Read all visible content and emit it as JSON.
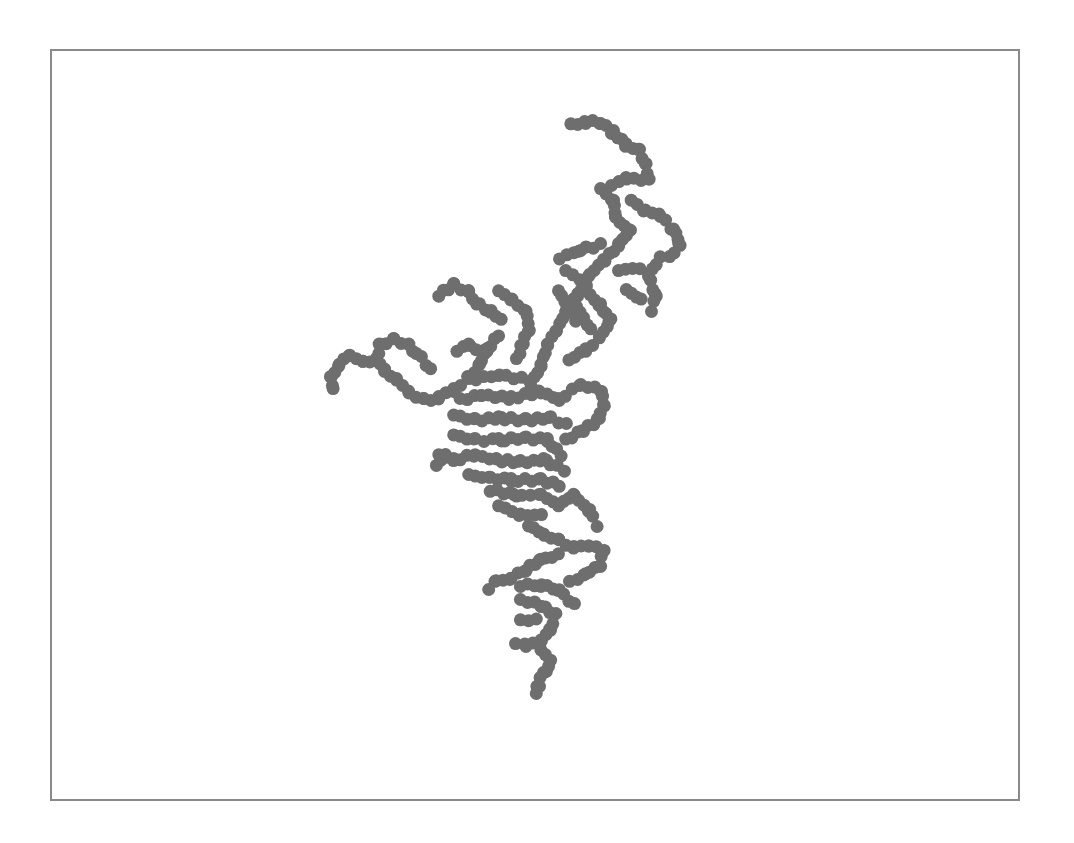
{
  "canvas": {
    "frame": {
      "x": 50,
      "y": 49,
      "width": 971,
      "height": 753,
      "border_color": "#8a8a8a",
      "background": "#ffffff"
    },
    "particle_color": "#6e6e6e",
    "particle_radius": 6.5,
    "shape": "diffusion-limited aggregation cluster",
    "segments": [
      [
        570,
        125,
        585,
        122
      ],
      [
        585,
        122,
        600,
        122
      ],
      [
        600,
        122,
        612,
        132
      ],
      [
        612,
        132,
        625,
        145
      ],
      [
        625,
        145,
        638,
        150
      ],
      [
        638,
        150,
        645,
        165
      ],
      [
        645,
        165,
        650,
        180
      ],
      [
        640,
        180,
        625,
        178
      ],
      [
        625,
        178,
        610,
        185
      ],
      [
        600,
        188,
        612,
        200
      ],
      [
        612,
        200,
        615,
        218
      ],
      [
        615,
        218,
        630,
        230
      ],
      [
        630,
        230,
        620,
        245
      ],
      [
        620,
        245,
        605,
        260
      ],
      [
        605,
        260,
        590,
        275
      ],
      [
        590,
        275,
        578,
        295
      ],
      [
        578,
        295,
        565,
        312
      ],
      [
        565,
        312,
        555,
        330
      ],
      [
        555,
        330,
        548,
        345
      ],
      [
        548,
        345,
        540,
        365
      ],
      [
        540,
        365,
        532,
        385
      ],
      [
        632,
        200,
        645,
        210
      ],
      [
        645,
        210,
        660,
        215
      ],
      [
        660,
        215,
        672,
        228
      ],
      [
        672,
        228,
        680,
        245
      ],
      [
        680,
        245,
        670,
        258
      ],
      [
        660,
        258,
        650,
        275
      ],
      [
        650,
        275,
        655,
        295
      ],
      [
        655,
        295,
        650,
        310
      ],
      [
        640,
        300,
        625,
        290
      ],
      [
        620,
        270,
        640,
        268
      ],
      [
        600,
        245,
        580,
        250
      ],
      [
        580,
        250,
        558,
        258
      ],
      [
        565,
        270,
        585,
        285
      ],
      [
        585,
        290,
        600,
        305
      ],
      [
        600,
        305,
        610,
        320
      ],
      [
        610,
        320,
        598,
        338
      ],
      [
        598,
        338,
        585,
        350
      ],
      [
        585,
        350,
        570,
        360
      ],
      [
        575,
        300,
        590,
        330
      ],
      [
        560,
        290,
        575,
        320
      ],
      [
        440,
        295,
        455,
        285
      ],
      [
        455,
        285,
        470,
        292
      ],
      [
        470,
        292,
        478,
        305
      ],
      [
        478,
        305,
        490,
        312
      ],
      [
        490,
        312,
        500,
        320
      ],
      [
        500,
        290,
        512,
        300
      ],
      [
        512,
        300,
        525,
        310
      ],
      [
        525,
        310,
        530,
        330
      ],
      [
        530,
        330,
        522,
        345
      ],
      [
        522,
        345,
        515,
        360
      ],
      [
        500,
        335,
        488,
        350
      ],
      [
        488,
        350,
        478,
        365
      ],
      [
        478,
        365,
        468,
        378
      ],
      [
        468,
        378,
        455,
        390
      ],
      [
        455,
        390,
        440,
        398
      ],
      [
        440,
        398,
        425,
        400
      ],
      [
        425,
        400,
        410,
        392
      ],
      [
        410,
        392,
        398,
        380
      ],
      [
        398,
        380,
        385,
        370
      ],
      [
        385,
        370,
        375,
        360
      ],
      [
        375,
        360,
        380,
        345
      ],
      [
        380,
        345,
        395,
        340
      ],
      [
        395,
        340,
        410,
        345
      ],
      [
        410,
        345,
        418,
        355
      ],
      [
        420,
        358,
        430,
        370
      ],
      [
        375,
        360,
        362,
        362
      ],
      [
        362,
        362,
        350,
        355
      ],
      [
        350,
        355,
        340,
        365
      ],
      [
        340,
        365,
        330,
        378
      ],
      [
        330,
        378,
        332,
        390
      ],
      [
        458,
        350,
        470,
        345
      ],
      [
        470,
        345,
        485,
        352
      ],
      [
        470,
        380,
        500,
        375
      ],
      [
        500,
        375,
        530,
        380
      ],
      [
        460,
        400,
        480,
        395
      ],
      [
        480,
        395,
        510,
        398
      ],
      [
        510,
        398,
        540,
        392
      ],
      [
        540,
        392,
        560,
        400
      ],
      [
        560,
        400,
        580,
        385
      ],
      [
        580,
        385,
        600,
        390
      ],
      [
        600,
        390,
        605,
        405
      ],
      [
        605,
        405,
        598,
        420
      ],
      [
        598,
        420,
        582,
        430
      ],
      [
        582,
        430,
        565,
        440
      ],
      [
        455,
        415,
        475,
        420
      ],
      [
        475,
        420,
        500,
        418
      ],
      [
        500,
        418,
        525,
        420
      ],
      [
        525,
        420,
        550,
        418
      ],
      [
        550,
        418,
        565,
        425
      ],
      [
        455,
        435,
        475,
        440
      ],
      [
        475,
        440,
        500,
        440
      ],
      [
        500,
        440,
        525,
        438
      ],
      [
        525,
        438,
        548,
        440
      ],
      [
        548,
        440,
        560,
        455
      ],
      [
        440,
        455,
        455,
        460
      ],
      [
        455,
        460,
        475,
        455
      ],
      [
        475,
        455,
        495,
        460
      ],
      [
        495,
        460,
        520,
        462
      ],
      [
        520,
        462,
        545,
        460
      ],
      [
        545,
        460,
        565,
        470
      ],
      [
        435,
        465,
        445,
        455
      ],
      [
        470,
        475,
        490,
        478
      ],
      [
        490,
        478,
        510,
        480
      ],
      [
        510,
        480,
        540,
        480
      ],
      [
        540,
        480,
        560,
        485
      ],
      [
        490,
        490,
        515,
        495
      ],
      [
        515,
        495,
        540,
        495
      ],
      [
        540,
        495,
        560,
        505
      ],
      [
        560,
        505,
        575,
        495
      ],
      [
        575,
        495,
        590,
        510
      ],
      [
        590,
        510,
        598,
        525
      ],
      [
        500,
        505,
        520,
        515
      ],
      [
        520,
        515,
        540,
        515
      ],
      [
        530,
        525,
        545,
        535
      ],
      [
        545,
        535,
        560,
        540
      ],
      [
        560,
        540,
        575,
        548
      ],
      [
        575,
        548,
        590,
        545
      ],
      [
        590,
        545,
        605,
        550
      ],
      [
        605,
        550,
        600,
        565
      ],
      [
        600,
        565,
        585,
        575
      ],
      [
        585,
        575,
        570,
        582
      ],
      [
        560,
        555,
        540,
        560
      ],
      [
        540,
        560,
        525,
        570
      ],
      [
        525,
        570,
        510,
        578
      ],
      [
        510,
        578,
        495,
        582
      ],
      [
        495,
        582,
        488,
        588
      ],
      [
        520,
        585,
        540,
        585
      ],
      [
        540,
        585,
        560,
        590
      ],
      [
        560,
        590,
        575,
        605
      ],
      [
        520,
        600,
        540,
        605
      ],
      [
        540,
        605,
        555,
        615
      ],
      [
        555,
        615,
        550,
        630
      ],
      [
        550,
        630,
        540,
        640
      ],
      [
        540,
        640,
        525,
        645
      ],
      [
        525,
        645,
        515,
        645
      ],
      [
        540,
        650,
        550,
        660
      ],
      [
        550,
        660,
        545,
        672
      ],
      [
        545,
        672,
        538,
        685
      ],
      [
        538,
        685,
        535,
        695
      ],
      [
        520,
        620,
        535,
        620
      ]
    ]
  }
}
